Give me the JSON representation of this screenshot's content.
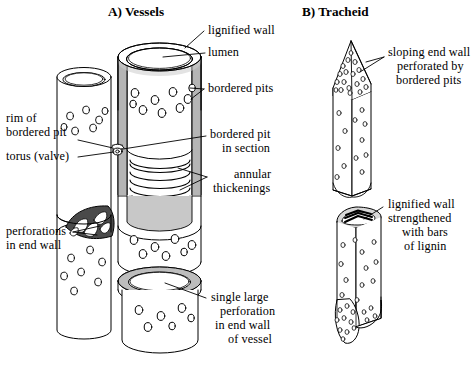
{
  "figure": {
    "background_color": "#ffffff",
    "line_color": "#000000",
    "wall_fill_color": "#b0b0b0",
    "lumen_fill_color": "#ffffff",
    "panels": [
      {
        "id": "A",
        "title": "A) Vessels"
      },
      {
        "id": "B",
        "title": "B) Tracheid"
      }
    ]
  },
  "panel_a": {
    "title": "A) Vessels",
    "labels": {
      "lignified_wall": "lignified wall",
      "lumen": "lumen",
      "bordered_pits": "bordered pits",
      "rim_of_bordered_pit_line1": "rim of",
      "rim_of_bordered_pit_line2": "bordered pit",
      "torus_valve": "torus (valve)",
      "bordered_pit_in_section_line1": "bordered pit",
      "bordered_pit_in_section_line2": "in section",
      "annular_thickenings_line1": "annular",
      "annular_thickenings_line2": "thickenings",
      "perforations_in_end_wall_line1": "perforations",
      "perforations_in_end_wall_line2": "in end wall",
      "single_large_perforation_line1": "single large",
      "single_large_perforation_line2": "perforation",
      "single_large_perforation_line3": "in end wall",
      "single_large_perforation_line4": "of vessel"
    }
  },
  "panel_b": {
    "title": "B) Tracheid",
    "labels": {
      "sloping_end_wall_line1": "sloping end wall",
      "sloping_end_wall_line2": "perforated by",
      "sloping_end_wall_line3": "bordered pits",
      "lignified_wall_bars_line1": "lignified wall",
      "lignified_wall_bars_line2": "strengthened",
      "lignified_wall_bars_line3": "with bars",
      "lignified_wall_bars_line4": "of lignin"
    }
  }
}
